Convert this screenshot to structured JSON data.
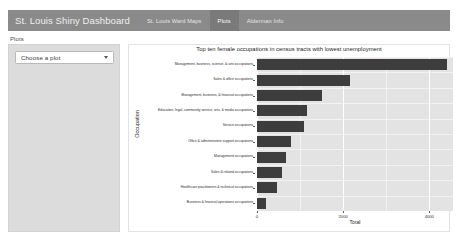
{
  "navbar": {
    "brand": "St. Louis Shiny Dashboard",
    "items": [
      {
        "label": "St. Louis Ward Maps",
        "active": false
      },
      {
        "label": "Plots",
        "active": true
      },
      {
        "label": "Alderman Info",
        "active": false
      }
    ]
  },
  "sidebar": {
    "label": "Plots",
    "select": {
      "value": "Choose a plot",
      "placeholder": "Choose a plot",
      "caret_icon": "chevron-down-icon"
    }
  },
  "colors": {
    "navbar_bg": "#8a8a8a",
    "navbar_active_bg": "#7a7a7a",
    "sidebar_bg": "#dcdcdc",
    "panel_bg": "#e3e3e3",
    "bar_fill": "#3d3d3d",
    "gridline_major": "#ffffff"
  },
  "chart_data": {
    "type": "bar",
    "orientation": "horizontal",
    "title": "Top ten female occupations in census tracts with lowest unemployment",
    "xlabel": "Total",
    "ylabel": "Occupation",
    "categories": [
      "Management, business, science, & arts occupations",
      "Sales & office occupations",
      "Management, business, & financial occupations",
      "Education, legal, community service, arts, & media occupations",
      "Service occupations",
      "Office & administrative support occupations",
      "Management occupations",
      "Sales & related occupations",
      "Healthcare practitioners & technical occupations",
      "Business & financial operations occupations"
    ],
    "values": [
      4400,
      2150,
      1500,
      1150,
      1100,
      780,
      680,
      570,
      470,
      200
    ],
    "xlim": [
      0,
      4550
    ],
    "xticks": [
      0,
      2000,
      4000
    ],
    "xtick_labels": [
      "0",
      "2000",
      "4000"
    ],
    "minor_xticks": [
      1000,
      3000
    ],
    "grid": true,
    "legend": "none"
  }
}
